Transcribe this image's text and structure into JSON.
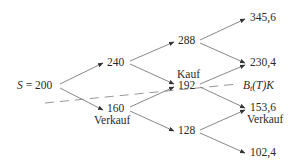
{
  "diagram": {
    "type": "binomial-tree",
    "colors": {
      "edge": "#6a6a6a",
      "dashed": "#8a8a8a",
      "text": "#2a2a2a"
    },
    "root": {
      "var": "S",
      "eq": " = 200"
    },
    "level1": {
      "up": {
        "value": "240"
      },
      "down": {
        "value": "160",
        "action": "Verkauf"
      }
    },
    "level2": {
      "uu": {
        "value": "288"
      },
      "ud": {
        "value": "192",
        "action": "Kauf"
      },
      "dd": {
        "value": "128"
      }
    },
    "level3": {
      "uuu": {
        "value": "345,6"
      },
      "uud": {
        "value": "230,4"
      },
      "udd": {
        "value": "153,6",
        "action": "Verkauf"
      },
      "ddd": {
        "value": "102,4"
      }
    },
    "threshold": {
      "B": "B",
      "sub": "t",
      "rest": "(T)K"
    }
  }
}
